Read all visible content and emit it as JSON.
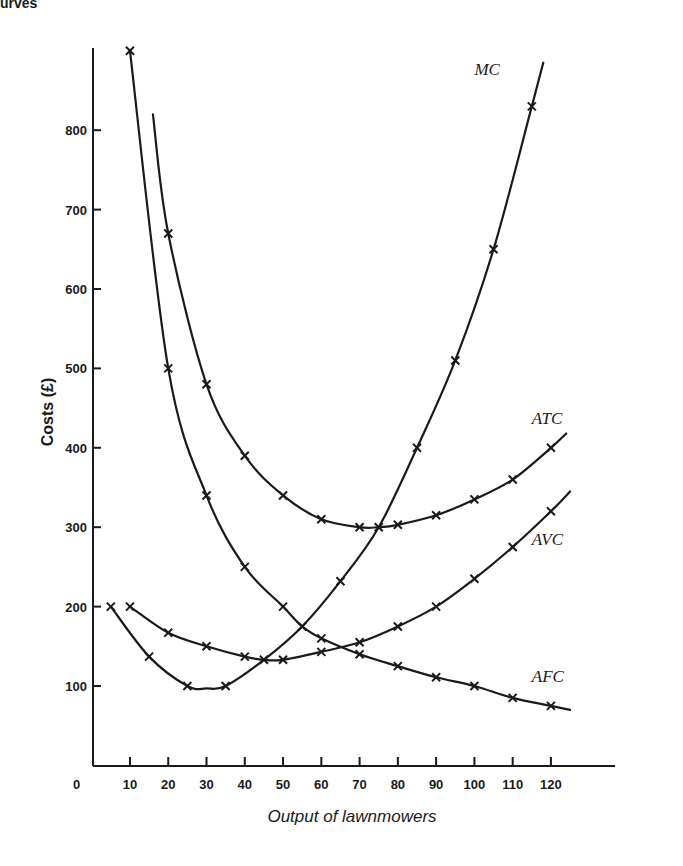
{
  "header_fragment": "urves",
  "chart_data": {
    "type": "line",
    "title": "",
    "xlabel": "Output of lawnmowers",
    "ylabel": "Costs (£)",
    "xlim": [
      0,
      130
    ],
    "ylim": [
      0,
      900
    ],
    "x_ticks": [
      10,
      20,
      30,
      40,
      50,
      60,
      70,
      80,
      90,
      100,
      110,
      120
    ],
    "x_tick_labels": [
      "10",
      "20",
      "30",
      "40",
      "50",
      "60",
      "70",
      "80",
      "90",
      "100",
      "110",
      "120"
    ],
    "origin_label": "0",
    "y_ticks": [
      100,
      200,
      300,
      400,
      500,
      600,
      700,
      800
    ],
    "y_tick_labels": [
      "100",
      "200",
      "300",
      "400",
      "500",
      "600",
      "700",
      "800"
    ],
    "grid": false,
    "legend": "inline curve labels",
    "series": [
      {
        "name": "MC",
        "label_pos": {
          "x": 100,
          "y": 870
        },
        "curve": [
          [
            5,
            200
          ],
          [
            15,
            137
          ],
          [
            25,
            100
          ],
          [
            30,
            97
          ],
          [
            35,
            100
          ],
          [
            45,
            133
          ],
          [
            55,
            175
          ],
          [
            65,
            232
          ],
          [
            75,
            300
          ],
          [
            85,
            400
          ],
          [
            95,
            510
          ],
          [
            105,
            650
          ],
          [
            115,
            830
          ],
          [
            118,
            885
          ]
        ],
        "markers": [
          [
            5,
            200
          ],
          [
            15,
            137
          ],
          [
            25,
            100
          ],
          [
            35,
            100
          ],
          [
            45,
            133
          ],
          [
            55,
            175
          ],
          [
            65,
            232
          ],
          [
            75,
            300
          ],
          [
            85,
            400
          ],
          [
            95,
            510
          ],
          [
            105,
            650
          ],
          [
            115,
            830
          ]
        ]
      },
      {
        "name": "ATC",
        "label_pos": {
          "x": 115,
          "y": 430
        },
        "curve": [
          [
            16,
            820
          ],
          [
            20,
            670
          ],
          [
            30,
            480
          ],
          [
            40,
            390
          ],
          [
            50,
            340
          ],
          [
            60,
            310
          ],
          [
            70,
            300
          ],
          [
            75,
            300
          ],
          [
            80,
            303
          ],
          [
            90,
            315
          ],
          [
            100,
            335
          ],
          [
            110,
            360
          ],
          [
            120,
            400
          ],
          [
            124,
            418
          ]
        ],
        "markers": [
          [
            20,
            670
          ],
          [
            30,
            480
          ],
          [
            40,
            390
          ],
          [
            50,
            340
          ],
          [
            60,
            310
          ],
          [
            70,
            300
          ],
          [
            80,
            303
          ],
          [
            90,
            315
          ],
          [
            100,
            335
          ],
          [
            110,
            360
          ],
          [
            120,
            400
          ]
        ]
      },
      {
        "name": "AVC",
        "label_pos": {
          "x": 115,
          "y": 278
        },
        "curve": [
          [
            10,
            200
          ],
          [
            20,
            167
          ],
          [
            30,
            150
          ],
          [
            40,
            137
          ],
          [
            45,
            133
          ],
          [
            50,
            133
          ],
          [
            60,
            143
          ],
          [
            70,
            155
          ],
          [
            80,
            175
          ],
          [
            90,
            200
          ],
          [
            100,
            235
          ],
          [
            110,
            275
          ],
          [
            120,
            320
          ],
          [
            125,
            345
          ]
        ],
        "markers": [
          [
            10,
            200
          ],
          [
            20,
            167
          ],
          [
            30,
            150
          ],
          [
            40,
            137
          ],
          [
            50,
            133
          ],
          [
            60,
            143
          ],
          [
            70,
            155
          ],
          [
            80,
            175
          ],
          [
            90,
            200
          ],
          [
            100,
            235
          ],
          [
            110,
            275
          ],
          [
            120,
            320
          ]
        ]
      },
      {
        "name": "AFC",
        "label_pos": {
          "x": 115,
          "y": 105
        },
        "curve": [
          [
            10,
            900
          ],
          [
            20,
            500
          ],
          [
            30,
            340
          ],
          [
            40,
            250
          ],
          [
            50,
            200
          ],
          [
            55,
            175
          ],
          [
            60,
            160
          ],
          [
            70,
            140
          ],
          [
            80,
            125
          ],
          [
            90,
            111
          ],
          [
            100,
            100
          ],
          [
            110,
            85
          ],
          [
            120,
            75
          ],
          [
            125,
            70
          ]
        ],
        "markers": [
          [
            10,
            900
          ],
          [
            20,
            500
          ],
          [
            30,
            340
          ],
          [
            40,
            250
          ],
          [
            50,
            200
          ],
          [
            60,
            160
          ],
          [
            70,
            140
          ],
          [
            80,
            125
          ],
          [
            90,
            111
          ],
          [
            100,
            100
          ],
          [
            110,
            85
          ],
          [
            120,
            75
          ]
        ]
      }
    ]
  }
}
